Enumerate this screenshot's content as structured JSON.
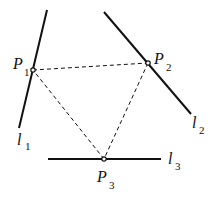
{
  "diagram": {
    "lines": [
      {
        "id": "l1",
        "label": "l",
        "sub": "1",
        "x1": 47,
        "y1": 10,
        "x2": 19,
        "y2": 128,
        "lx": 17,
        "ly": 145,
        "sx": 25,
        "sy": 150
      },
      {
        "id": "l2",
        "label": "l",
        "sub": "2",
        "x1": 104,
        "y1": 12,
        "x2": 191,
        "y2": 114,
        "lx": 192,
        "ly": 128,
        "sx": 199,
        "sy": 134
      },
      {
        "id": "l3",
        "label": "l",
        "sub": "3",
        "x1": 48,
        "y1": 159,
        "x2": 161,
        "y2": 159,
        "lx": 168,
        "ly": 164,
        "sx": 175,
        "sy": 170
      }
    ],
    "points": [
      {
        "id": "P1",
        "label": "P",
        "sub": "1",
        "x": 33,
        "y": 70,
        "lx": 13,
        "ly": 69,
        "sx": 24,
        "sy": 76
      },
      {
        "id": "P2",
        "label": "P",
        "sub": "2",
        "x": 148,
        "y": 63,
        "lx": 154,
        "ly": 64,
        "sx": 166,
        "sy": 71
      },
      {
        "id": "P3",
        "label": "P",
        "sub": "3",
        "x": 104,
        "y": 159,
        "lx": 97,
        "ly": 182,
        "sx": 109,
        "sy": 189
      }
    ],
    "dashed_edges": [
      {
        "from": "P1",
        "to": "P2"
      },
      {
        "from": "P2",
        "to": "P3"
      },
      {
        "from": "P3",
        "to": "P1"
      }
    ],
    "colors": {
      "stroke": "#111111",
      "background": "#ffffff"
    }
  }
}
